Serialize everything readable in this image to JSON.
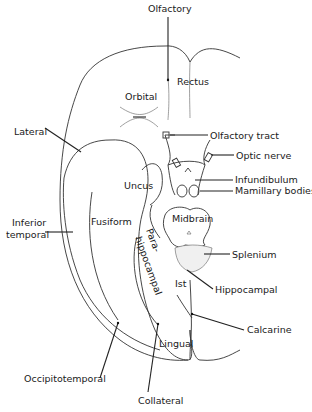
{
  "labels": {
    "olfactory": "Olfactory",
    "rectus": "Rectus",
    "orbital": "Orbital",
    "lateral": "Lateral",
    "olfactory_tract": "Olfactory tract",
    "optic_nerve": "Optic nerve",
    "infundibulum": "Infundibulum",
    "mamillary_bodies": "Mamillary bodies",
    "uncus": "Uncus",
    "midbrain": "Midbrain",
    "inferior": "Inferior",
    "temporal": "temporal",
    "fusiform": "Fusiform",
    "para": "Para-",
    "hippocampal_gyrus": "hippocampal",
    "splenium": "Splenium",
    "hippocampal": "Hippocampal",
    "ist": "Ist",
    "calcarine": "Calcarine",
    "lingual": "Lingual",
    "occipitotemporal": "Occipitotemporal",
    "collateral": "Collateral"
  }
}
